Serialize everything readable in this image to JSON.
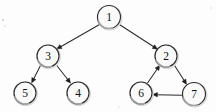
{
  "figure": {
    "kind": "node-link-diagram",
    "background_color": "#fdfdfd",
    "stroke_color": "#2b2b2b",
    "node_fill_color": "#fafafa",
    "label_color": "#101010",
    "width": 216,
    "height": 112
  },
  "nodes": [
    {
      "id": "1",
      "label": "1",
      "cx": 109,
      "cy": 17,
      "r": 11.5
    },
    {
      "id": "3",
      "label": "3",
      "cx": 48,
      "cy": 56,
      "r": 11.0
    },
    {
      "id": "2",
      "label": "2",
      "cx": 166,
      "cy": 56,
      "r": 11.0
    },
    {
      "id": "5",
      "label": "5",
      "cx": 25,
      "cy": 93,
      "r": 11.0
    },
    {
      "id": "4",
      "label": "4",
      "cx": 78,
      "cy": 93,
      "r": 11.0
    },
    {
      "id": "6",
      "label": "6",
      "cx": 141,
      "cy": 93,
      "r": 11.0
    },
    {
      "id": "7",
      "label": "7",
      "cx": 194,
      "cy": 94,
      "r": 11.5
    }
  ],
  "edges": [
    {
      "id": "e1",
      "from": "1",
      "to": "3",
      "directed": true,
      "x1": 100.0,
      "y1": 24.2,
      "x2": 56.6,
      "y2": 49.1
    },
    {
      "id": "e2",
      "from": "1",
      "to": "2",
      "directed": true,
      "x1": 118.2,
      "y1": 23.8,
      "x2": 157.6,
      "y2": 49.3
    },
    {
      "id": "e3",
      "from": "3",
      "to": "5",
      "directed": true,
      "x1": 41.0,
      "y1": 64.6,
      "x2": 31.6,
      "y2": 83.0
    },
    {
      "id": "e4",
      "from": "3",
      "to": "4",
      "directed": true,
      "x1": 55.8,
      "y1": 64.2,
      "x2": 70.6,
      "y2": 83.2
    },
    {
      "id": "e5",
      "from": "2",
      "to": "7",
      "directed": true,
      "x1": 173.6,
      "y1": 64.0,
      "x2": 186.6,
      "y2": 84.4
    },
    {
      "id": "e6",
      "from": "6",
      "to": "2",
      "directed": true,
      "x1": 147.4,
      "y1": 83.2,
      "x2": 159.8,
      "y2": 65.2
    },
    {
      "id": "e7",
      "from": "7",
      "to": "6",
      "directed": true,
      "x1": 182.6,
      "y1": 95.2,
      "x2": 152.4,
      "y2": 94.6
    }
  ],
  "specks": [
    {
      "cx": 3,
      "cy": 20,
      "r": 1.1
    },
    {
      "cx": 5,
      "cy": 26,
      "r": 0.8
    },
    {
      "cx": 211,
      "cy": 8,
      "r": 0.7
    },
    {
      "cx": 119,
      "cy": 107,
      "r": 0.7
    }
  ]
}
